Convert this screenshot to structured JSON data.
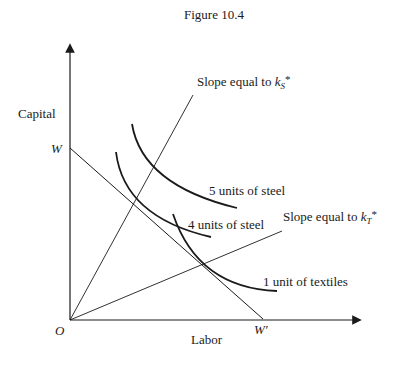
{
  "figure": {
    "title": "Figure 10.4"
  },
  "axes": {
    "y_label": "Capital",
    "x_label": "Labor",
    "origin_label": "O",
    "w_label": "W",
    "w_prime_label": "W′"
  },
  "rays": {
    "steel": {
      "prefix": "Slope equal to ",
      "k": "k",
      "subscript": "S",
      "star": "*"
    },
    "textiles": {
      "prefix": "Slope equal to ",
      "k": "k",
      "subscript": "T",
      "star": "*"
    }
  },
  "isoquants": [
    {
      "label": "5 units of steel"
    },
    {
      "label": "4 units of steel"
    },
    {
      "label": "1 unit of textiles"
    }
  ],
  "colors": {
    "ink": "#1a1a1a",
    "background": "#ffffff"
  }
}
